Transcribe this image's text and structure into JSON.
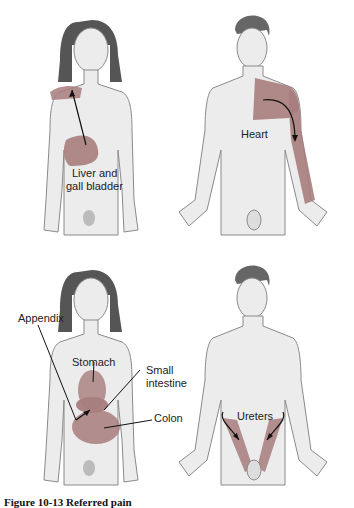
{
  "figure": {
    "caption": "Figure 10-13 Referred pain",
    "overlay_color": "#a87d7d",
    "skin_color": "#ececec",
    "outline_color": "#8a8a8a",
    "hair_color": "#555555"
  },
  "panels": [
    {
      "figure": "female",
      "labels": [
        "Liver and",
        "gall bladder"
      ]
    },
    {
      "figure": "male",
      "labels": [
        "Heart"
      ]
    },
    {
      "figure": "female",
      "labels": [
        "Appendix",
        "Stomach",
        "Small",
        "intestine",
        "Colon"
      ]
    },
    {
      "figure": "male",
      "labels": [
        "Ureters"
      ]
    }
  ]
}
